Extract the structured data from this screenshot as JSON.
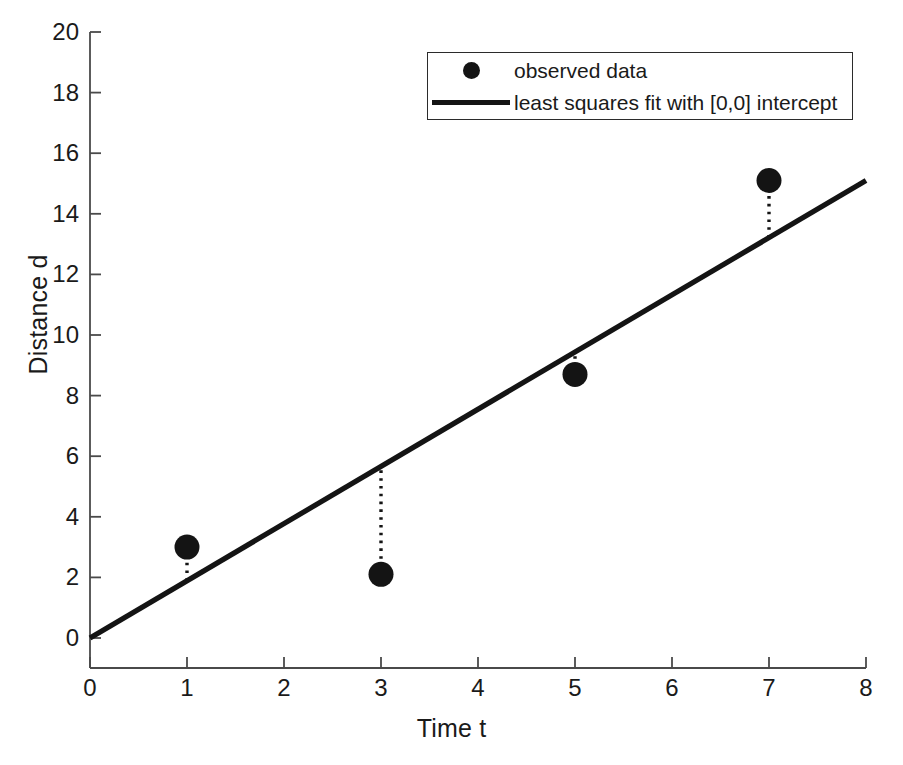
{
  "chart_data": {
    "type": "scatter",
    "title": "",
    "xlabel": "Time t",
    "ylabel": "Distance d",
    "xlim": [
      0,
      8
    ],
    "ylim": [
      0,
      20
    ],
    "xticks": [
      0,
      1,
      2,
      3,
      4,
      5,
      6,
      7,
      8
    ],
    "yticks": [
      0,
      2,
      4,
      6,
      8,
      10,
      12,
      14,
      16,
      18,
      20
    ],
    "grid": false,
    "legend_position": "top-right",
    "series": [
      {
        "name": "observed data",
        "type": "scatter",
        "marker": "filled-circle",
        "color": "#141414",
        "x": [
          1,
          3,
          5,
          7
        ],
        "y": [
          3.0,
          2.1,
          8.7,
          15.1
        ]
      },
      {
        "name": "least squares fit with [0,0] intercept",
        "type": "line",
        "color": "#141414",
        "slope": 1.888,
        "intercept": 0,
        "x": [
          0,
          8
        ],
        "y": [
          0,
          15.1
        ]
      }
    ],
    "residuals": [
      {
        "x": 1,
        "y_data": 3.0,
        "y_fit": 1.888
      },
      {
        "x": 3,
        "y_data": 2.1,
        "y_fit": 5.664
      },
      {
        "x": 5,
        "y_data": 8.7,
        "y_fit": 9.44
      },
      {
        "x": 7,
        "y_data": 15.1,
        "y_fit": 13.216
      }
    ]
  },
  "axes": {
    "xlabel": "Time t",
    "ylabel": "Distance d",
    "xtick_labels": [
      "0",
      "1",
      "2",
      "3",
      "4",
      "5",
      "6",
      "7",
      "8"
    ],
    "ytick_labels": [
      "0",
      "2",
      "4",
      "6",
      "8",
      "10",
      "12",
      "14",
      "16",
      "18",
      "20"
    ]
  },
  "legend": {
    "entries": [
      {
        "label": "observed data",
        "marker": "filled-circle"
      },
      {
        "label": "least squares fit with [0,0] intercept",
        "marker": "solid-line"
      }
    ]
  },
  "colors": {
    "foreground": "#1a1a1a",
    "data": "#141414",
    "axis": "#4a4a4a",
    "background": "#ffffff"
  }
}
